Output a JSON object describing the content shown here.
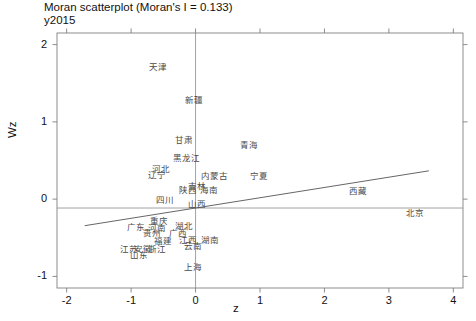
{
  "chart_data": {
    "type": "scatter",
    "title": "Moran scatterplot (Moran's I = 0.133)",
    "subtitle": "y2015",
    "xlabel": "z",
    "ylabel": "Wz",
    "xlim": [
      -2.15,
      4.15
    ],
    "ylim": [
      -1.15,
      2.15
    ],
    "xticks": [
      -2,
      -1,
      0,
      1,
      2,
      3,
      4
    ],
    "yticks": [
      -1,
      0,
      1,
      2
    ],
    "xtick_labels": [
      "-2",
      "-1",
      "0",
      "1",
      "2",
      "3",
      "4"
    ],
    "ytick_labels": [
      "-1",
      "0",
      "1",
      "2"
    ],
    "grid": false,
    "legend": null,
    "morans_i": 0.133,
    "regression_line": {
      "slope": 0.133,
      "intercept": -0.115,
      "x_start": -1.72,
      "x_end": 3.62,
      "color": "#666666"
    },
    "reference_line": {
      "type": "horizontal",
      "y": -0.115,
      "color": "#8a8a8a"
    },
    "vertical_reference_line": {
      "type": "vertical",
      "x": 0.0,
      "color": "#8a8a8a"
    },
    "point_label_color": "#4a4a4a",
    "points": [
      {
        "label": "天津",
        "x": -0.58,
        "y": 1.72
      },
      {
        "label": "新疆",
        "x": -0.02,
        "y": 1.29
      },
      {
        "label": "甘肃",
        "x": -0.18,
        "y": 0.78
      },
      {
        "label": "青海",
        "x": 0.83,
        "y": 0.72
      },
      {
        "label": "黑龙江",
        "x": -0.14,
        "y": 0.55
      },
      {
        "label": "河北",
        "x": -0.53,
        "y": 0.4
      },
      {
        "label": "辽宁",
        "x": -0.6,
        "y": 0.32
      },
      {
        "label": "内蒙古",
        "x": 0.29,
        "y": 0.31
      },
      {
        "label": "宁夏",
        "x": 0.98,
        "y": 0.31
      },
      {
        "label": "陕西",
        "x": -0.12,
        "y": 0.13
      },
      {
        "label": "吉林",
        "x": 0.02,
        "y": 0.18
      },
      {
        "label": "海南",
        "x": 0.21,
        "y": 0.13
      },
      {
        "label": "西藏",
        "x": 2.52,
        "y": 0.12
      },
      {
        "label": "四川",
        "x": -0.48,
        "y": 0.0
      },
      {
        "label": "山西",
        "x": 0.02,
        "y": -0.05
      },
      {
        "label": "北京",
        "x": 3.4,
        "y": -0.17
      },
      {
        "label": "重庆",
        "x": -0.56,
        "y": -0.27
      },
      {
        "label": "河南",
        "x": -0.6,
        "y": -0.36
      },
      {
        "label": "湖北",
        "x": -0.18,
        "y": -0.33
      },
      {
        "label": "广东",
        "x": -0.93,
        "y": -0.35
      },
      {
        "label": "贵州",
        "x": -0.68,
        "y": -0.43
      },
      {
        "label": "广西",
        "x": -0.28,
        "y": -0.43
      },
      {
        "label": "江西",
        "x": -0.12,
        "y": -0.52
      },
      {
        "label": "湖南",
        "x": 0.22,
        "y": -0.51
      },
      {
        "label": "福建",
        "x": -0.5,
        "y": -0.53
      },
      {
        "label": "云南",
        "x": -0.04,
        "y": -0.59
      },
      {
        "label": "江苏",
        "x": -1.04,
        "y": -0.63
      },
      {
        "label": "安徽",
        "x": -0.81,
        "y": -0.63
      },
      {
        "label": "浙江",
        "x": -0.6,
        "y": -0.63
      },
      {
        "label": "山东",
        "x": -0.88,
        "y": -0.71
      },
      {
        "label": "上海",
        "x": -0.04,
        "y": -0.86
      }
    ]
  },
  "axes": {
    "box_color": "#808080",
    "tick_color": "#808080"
  }
}
